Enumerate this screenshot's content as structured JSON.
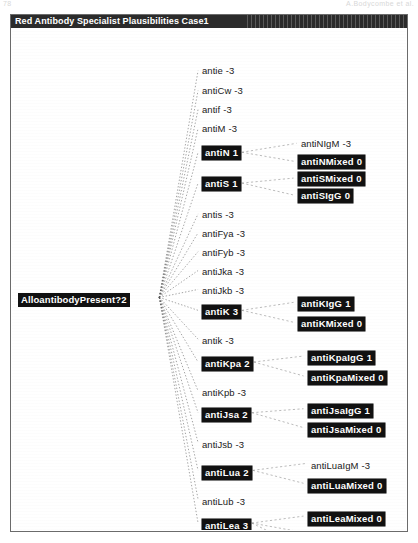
{
  "scan": {
    "top_left_mark": "78",
    "top_right_mark": "A.Bodycombe et al."
  },
  "window": {
    "title": "Red Antibody Specialist Plausibilities Case1"
  },
  "root": {
    "label": "AlloantibodyPresent?",
    "value": "2",
    "selected": true
  },
  "colors": {
    "selected_bg": "#111111",
    "selected_fg": "#ffffff",
    "text": "#1a1a1a",
    "edge": "#5a5a5a",
    "titlebar_bg": "#2b2b2b",
    "window_border": "#6b6b6b"
  },
  "level1": [
    {
      "label": "antie",
      "value": "-3",
      "selected": false,
      "y": 36,
      "children": []
    },
    {
      "label": "antiCw",
      "value": "-3",
      "selected": false,
      "y": 56,
      "children": []
    },
    {
      "label": "antif",
      "value": "-3",
      "selected": false,
      "y": 75,
      "children": []
    },
    {
      "label": "antiM",
      "value": "-3",
      "selected": false,
      "y": 94,
      "children": []
    },
    {
      "label": "antiN",
      "value": "1",
      "selected": true,
      "y": 117,
      "children": [
        0,
        1
      ]
    },
    {
      "label": "antiS",
      "value": "1",
      "selected": true,
      "y": 148,
      "children": [
        2,
        3
      ]
    },
    {
      "label": "antis",
      "value": "-3",
      "selected": false,
      "y": 180,
      "children": []
    },
    {
      "label": "antiFya",
      "value": "-3",
      "selected": false,
      "y": 199,
      "children": []
    },
    {
      "label": "antiFyb",
      "value": "-3",
      "selected": false,
      "y": 218,
      "children": []
    },
    {
      "label": "antiJka",
      "value": "-3",
      "selected": false,
      "y": 237,
      "children": []
    },
    {
      "label": "antiJkb",
      "value": "-3",
      "selected": false,
      "y": 256,
      "children": []
    },
    {
      "label": "antiK",
      "value": "3",
      "selected": true,
      "y": 276,
      "children": [
        4,
        5
      ]
    },
    {
      "label": "antik",
      "value": "-3",
      "selected": false,
      "y": 306,
      "children": []
    },
    {
      "label": "antiKpa",
      "value": "2",
      "selected": true,
      "y": 328,
      "children": [
        6,
        7
      ]
    },
    {
      "label": "antiKpb",
      "value": "-3",
      "selected": false,
      "y": 358,
      "children": []
    },
    {
      "label": "antiJsa",
      "value": "2",
      "selected": true,
      "y": 379,
      "children": [
        8,
        9
      ]
    },
    {
      "label": "antiJsb",
      "value": "-3",
      "selected": false,
      "y": 410,
      "children": []
    },
    {
      "label": "antiLua",
      "value": "2",
      "selected": true,
      "y": 437,
      "children": [
        10,
        11
      ]
    },
    {
      "label": "antiLub",
      "value": "-3",
      "selected": false,
      "y": 467,
      "children": []
    },
    {
      "label": "antiLea",
      "value": "3",
      "selected": true,
      "y": 490,
      "children": [
        12,
        13,
        14
      ]
    }
  ],
  "level2": [
    {
      "label": "antiNIgM",
      "value": "-3",
      "selected": false,
      "y": 109,
      "x": 289
    },
    {
      "label": "antiNMixed",
      "value": "0",
      "selected": true,
      "y": 126,
      "x": 286
    },
    {
      "label": "antiSMixed",
      "value": "0",
      "selected": true,
      "y": 143,
      "x": 286
    },
    {
      "label": "antiSIgG",
      "value": "0",
      "selected": true,
      "y": 160,
      "x": 286
    },
    {
      "label": "antiKIgG",
      "value": "1",
      "selected": true,
      "y": 268,
      "x": 286
    },
    {
      "label": "antiKMixed",
      "value": "0",
      "selected": true,
      "y": 288,
      "x": 286
    },
    {
      "label": "antiKpaIgG",
      "value": "1",
      "selected": true,
      "y": 322,
      "x": 296
    },
    {
      "label": "antiKpaMixed",
      "value": "0",
      "selected": true,
      "y": 342,
      "x": 296
    },
    {
      "label": "antiJsaIgG",
      "value": "1",
      "selected": true,
      "y": 375,
      "x": 296
    },
    {
      "label": "antiJsaMixed",
      "value": "0",
      "selected": true,
      "y": 394,
      "x": 296
    },
    {
      "label": "antiLuaIgM",
      "value": "-3",
      "selected": false,
      "y": 431,
      "x": 299
    },
    {
      "label": "antiLuaMixed",
      "value": "0",
      "selected": true,
      "y": 450,
      "x": 296
    },
    {
      "label": "antiLeaMixed",
      "value": "0",
      "selected": true,
      "y": 483,
      "x": 296
    },
    {
      "label": "antiLeaIgM",
      "value": "-3",
      "selected": false,
      "y": 501,
      "x": 299
    },
    {
      "label": "antiLebIgM",
      "value": "0",
      "selected": false,
      "y": 518,
      "x": 299
    }
  ]
}
